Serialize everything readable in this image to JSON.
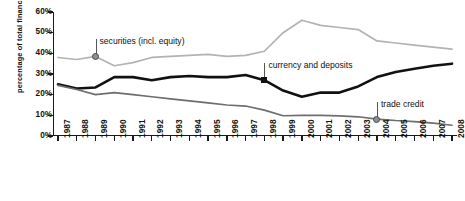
{
  "chart_data": {
    "type": "line",
    "title": "",
    "xlabel": "",
    "ylabel": "percentage of total financial assets",
    "ylim": [
      0,
      60
    ],
    "ytick_labels": [
      "0%",
      "10%",
      "20%",
      "30%",
      "40%",
      "50%",
      "60%"
    ],
    "ytick_values": [
      0,
      10,
      20,
      30,
      40,
      50,
      60
    ],
    "grid": false,
    "legend_position": "inline-annotations",
    "categories": [
      "1987",
      "1988",
      "1989",
      "1990",
      "1991",
      "1992",
      "1993",
      "1994",
      "1995",
      "1996",
      "1997",
      "1998",
      "1999",
      "2000",
      "2001",
      "2002",
      "2003",
      "2004",
      "2005",
      "2006",
      "2007",
      "2008"
    ],
    "series": [
      {
        "name": "securities (incl. equity)",
        "color": "#b3b3b3",
        "values": [
          38,
          37,
          38.5,
          34,
          35.5,
          38,
          38.5,
          39,
          39.5,
          38.5,
          39,
          41,
          50,
          56,
          53.5,
          52.5,
          51.5,
          46,
          45,
          44,
          43,
          42
        ]
      },
      {
        "name": "currency and deposits",
        "color": "#111111",
        "values": [
          25,
          23,
          23.5,
          28.5,
          28.5,
          27,
          28.5,
          29,
          28.5,
          28.5,
          29.5,
          27,
          22,
          19,
          21,
          21,
          24,
          28.5,
          31,
          32.5,
          34,
          35
        ]
      },
      {
        "name": "trade credit",
        "color": "#6e6e6e",
        "values": [
          24.5,
          22.5,
          20,
          21,
          20,
          19,
          18,
          17,
          16,
          15,
          14.5,
          12.5,
          9.8,
          10,
          10,
          9.7,
          9.3,
          8.2,
          7.5,
          7,
          6.2,
          5.2
        ]
      }
    ],
    "annotations": [
      {
        "text": "securities (incl. equity)",
        "series": "securities (incl. equity)",
        "year": "1989",
        "value": 38.5,
        "marker": "circle"
      },
      {
        "text": "currency and deposits",
        "series": "currency and deposits",
        "year": "1998",
        "value": 27,
        "marker": "square"
      },
      {
        "text": "trade credit",
        "series": "trade credit",
        "year": "2004",
        "value": 8.2,
        "marker": "circle"
      }
    ]
  }
}
